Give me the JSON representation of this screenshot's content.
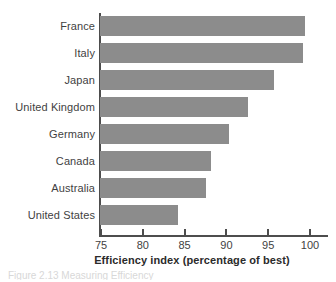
{
  "chart_data": {
    "type": "bar",
    "orientation": "horizontal",
    "title": "",
    "xlabel": "Efficiency index (percentage of best)",
    "ylabel": "",
    "xlim": [
      75,
      100.3
    ],
    "grid": false,
    "legend": null,
    "bar_color": "#8c8c8c",
    "axis_color": "#4d4d4d",
    "categories": [
      "France",
      "Italy",
      "Japan",
      "United Kingdom",
      "Germany",
      "Canada",
      "Australia",
      "United States"
    ],
    "values": [
      99.5,
      99.3,
      95.8,
      92.7,
      90.4,
      88.3,
      87.7,
      84.3
    ],
    "xticks": [
      75,
      80,
      85,
      90,
      95,
      100
    ],
    "xticklabels": [
      "75",
      "80",
      "85",
      "90",
      "95",
      "100"
    ]
  },
  "footer": {
    "cropped_caption": "Figure 2.13  Measuring Efficiency"
  }
}
